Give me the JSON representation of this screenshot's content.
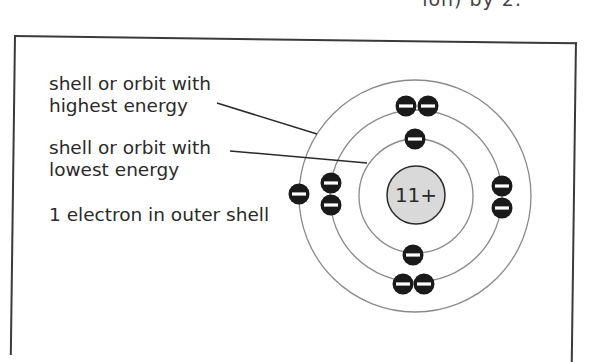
{
  "page_fragment": {
    "text": "ion) by 2."
  },
  "labels": {
    "highest": {
      "line1": "shell or orbit with",
      "line2": "highest energy"
    },
    "lowest": {
      "line1": "shell or orbit with",
      "line2": "lowest energy"
    },
    "outer": {
      "line1": "1 electron in outer shell"
    }
  },
  "atom": {
    "element": "sodium",
    "nucleus_charge": "11+",
    "center": [
      416,
      196
    ],
    "shells": [
      {
        "name": "inner",
        "radius": 57,
        "electrons": 2
      },
      {
        "name": "middle",
        "radius": 86,
        "electrons": 8
      },
      {
        "name": "outer",
        "radius": 116,
        "electrons": 1
      }
    ],
    "electron_symbol": "−",
    "colors": {
      "electron_fill": "#1a1a1a",
      "electron_symbol": "#ffffff",
      "nucleus_fill": "#d9d9d9",
      "shell_stroke": "#8a8a8a",
      "leader_line": "#2a2a2a",
      "frame": "#3a3a3a"
    }
  }
}
